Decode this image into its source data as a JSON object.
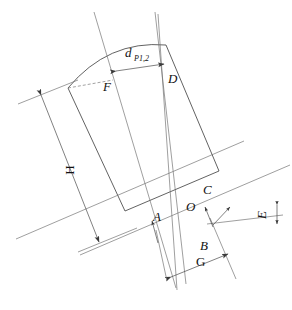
{
  "figure": {
    "type": "technical-line-diagram",
    "background_color": "#ffffff",
    "line_color": "#3a3a3a",
    "thin_line_color": "#6b6b6b"
  },
  "labels": {
    "d_main": "d",
    "d_subscript": "Р1,2",
    "point_D": "D",
    "point_F": "F",
    "point_A": "A",
    "point_O": "O",
    "point_B": "B",
    "point_C": "C",
    "dim_H": "H",
    "dim_G": "G",
    "dim_E": "E"
  },
  "annotations": [
    {
      "name": "d-p12-dimension",
      "text": "d",
      "subscript": "Р1,2",
      "kind": "dimension",
      "orientation": "horizontal-tilted",
      "x": 129,
      "y": 58
    },
    {
      "name": "label-D",
      "text": "D",
      "kind": "point",
      "x": 172,
      "y": 79
    },
    {
      "name": "label-F",
      "text": "F",
      "kind": "point",
      "x": 106,
      "y": 88
    },
    {
      "name": "label-H",
      "text": "H",
      "kind": "dimension",
      "orientation": "rotated-vertical",
      "x": 74,
      "y": 170
    },
    {
      "name": "label-C",
      "text": "C",
      "kind": "point",
      "x": 206,
      "y": 190
    },
    {
      "name": "label-O",
      "text": "O",
      "kind": "point",
      "x": 190,
      "y": 206
    },
    {
      "name": "label-A",
      "text": "A",
      "kind": "point",
      "x": 157,
      "y": 216
    },
    {
      "name": "label-E",
      "text": "E",
      "kind": "dimension",
      "orientation": "rotated-vertical",
      "x": 266,
      "y": 214
    },
    {
      "name": "label-B",
      "text": "B",
      "kind": "point",
      "x": 203,
      "y": 245
    },
    {
      "name": "label-G",
      "text": "G",
      "kind": "dimension",
      "orientation": "horizontal-tilted",
      "x": 196,
      "y": 265
    }
  ]
}
